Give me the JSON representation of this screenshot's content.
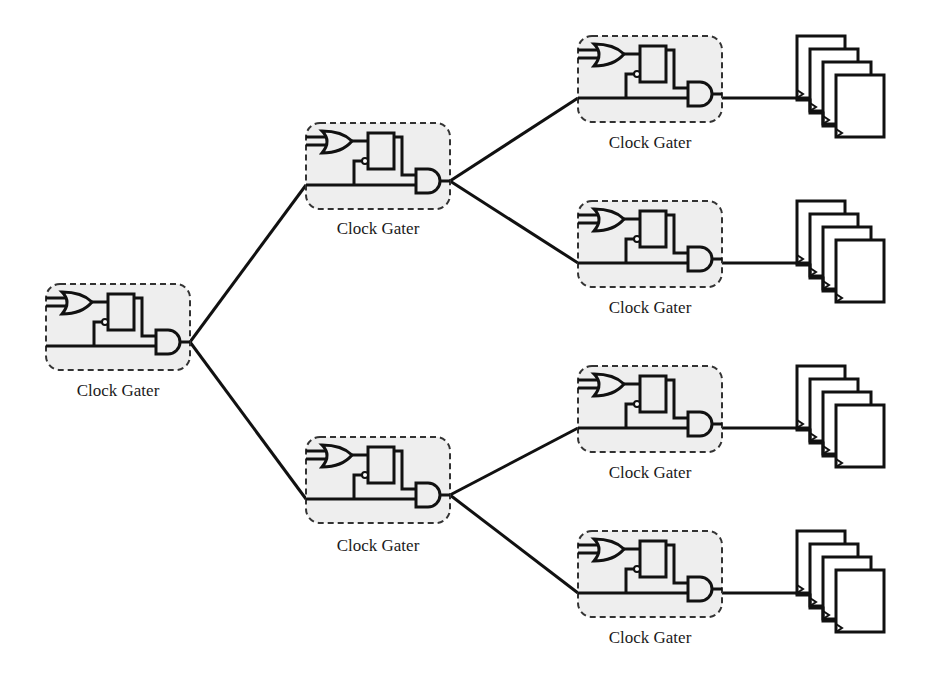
{
  "diagram": {
    "colors": {
      "stroke": "#111111",
      "gater_fill": "#eeeeee",
      "gater_border": "#333333"
    },
    "gater_label": "Clock Gater",
    "gaters": [
      {
        "id": "root",
        "label": "Clock Gater",
        "x": 46,
        "y": 284
      },
      {
        "id": "l2-top",
        "label": "Clock Gater",
        "x": 306,
        "y": 123
      },
      {
        "id": "l2-bottom",
        "label": "Clock Gater",
        "x": 306,
        "y": 437
      },
      {
        "id": "l3-1",
        "label": "Clock Gater",
        "x": 578,
        "y": 36
      },
      {
        "id": "l3-2",
        "label": "Clock Gater",
        "x": 578,
        "y": 201
      },
      {
        "id": "l3-3",
        "label": "Clock Gater",
        "x": 578,
        "y": 366
      },
      {
        "id": "l3-4",
        "label": "Clock Gater",
        "x": 578,
        "y": 531
      }
    ],
    "flip_flop_banks": [
      {
        "id": "ff-bank-1",
        "count": 4,
        "x": 797,
        "y": 36
      },
      {
        "id": "ff-bank-2",
        "count": 4,
        "x": 797,
        "y": 199
      },
      {
        "id": "ff-bank-3",
        "count": 4,
        "x": 797,
        "y": 364
      },
      {
        "id": "ff-bank-4",
        "count": 4,
        "x": 797,
        "y": 530
      }
    ],
    "labels": {
      "g0": "Clock Gater",
      "g1": "Clock Gater",
      "g2": "Clock Gater",
      "g3": "Clock Gater",
      "g4": "Clock Gater",
      "g5": "Clock Gater",
      "g6": "Clock Gater"
    }
  }
}
